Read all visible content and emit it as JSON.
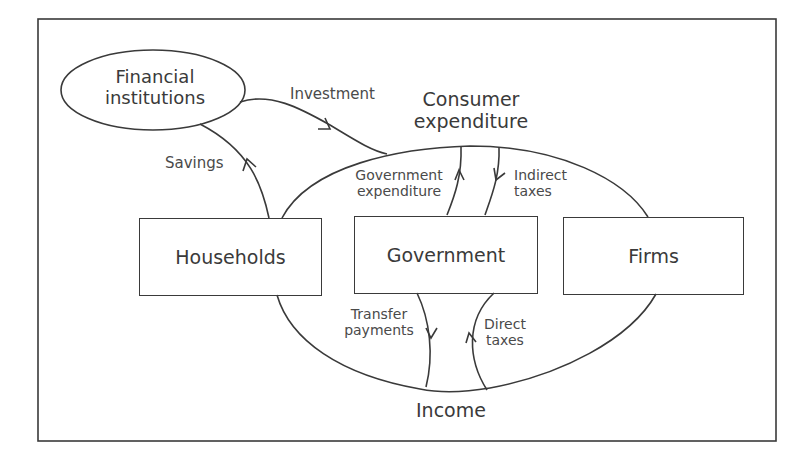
{
  "diagram": {
    "nodes": {
      "financial_institutions": {
        "line1": "Financial",
        "line2": "institutions"
      },
      "households": "Households",
      "government": "Government",
      "firms": "Firms"
    },
    "flows": {
      "investment": "Investment",
      "savings": "Savings",
      "consumer_expenditure": {
        "line1": "Consumer",
        "line2": "expenditure"
      },
      "government_expenditure": {
        "line1": "Government",
        "line2": "expenditure"
      },
      "indirect_taxes": {
        "line1": "Indirect",
        "line2": "taxes"
      },
      "transfer_payments": {
        "line1": "Transfer",
        "line2": "payments"
      },
      "direct_taxes": {
        "line1": "Direct",
        "line2": "taxes"
      },
      "income": "Income"
    },
    "colors": {
      "stroke": "#3a3a3a",
      "text": "#4a4a4a",
      "background": "#ffffff"
    }
  }
}
